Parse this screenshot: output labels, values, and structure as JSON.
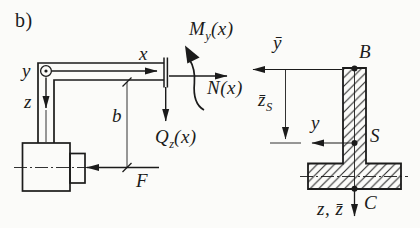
{
  "panel_label": "b)",
  "colors": {
    "ink": "#1b1b1b",
    "paper": "#fbfbf9",
    "hatch": "#2b2b2b"
  },
  "beam_view": {
    "axis_x": "x",
    "axis_y": "y",
    "axis_z": "z",
    "moment_label": {
      "main": "M",
      "sub": "y",
      "arg": "(x)"
    },
    "normal_label": {
      "main": "N",
      "arg": "(x)"
    },
    "shear_label": {
      "main": "Q",
      "sub": "z",
      "arg": "(x)"
    },
    "dim_b": "b",
    "force_f": "F"
  },
  "section_view": {
    "axis_ybar": "ȳ",
    "dim_zbar": {
      "main": "z̄",
      "sub": "S"
    },
    "axis_y": "y",
    "axis_z": "z, z̄",
    "point_top": "B",
    "point_centroid": "S",
    "point_bottom": "C"
  }
}
